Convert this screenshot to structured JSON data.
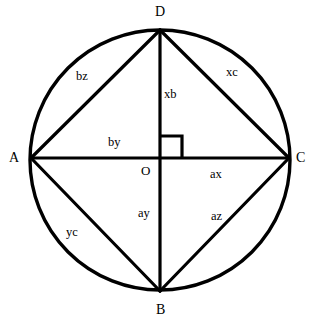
{
  "figure": {
    "background_color": "#ffffff",
    "stroke_color": "#000000",
    "circle": {
      "center_x": 160,
      "center_y": 160,
      "radius": 130,
      "stroke_width": 3.4
    },
    "vertices": [
      {
        "id": "D",
        "label": "D",
        "x": 160,
        "y": 30,
        "label_x": 155,
        "label_y": 5
      },
      {
        "id": "A",
        "label": "A",
        "x": 31,
        "y": 158,
        "label_x": 9,
        "label_y": 151
      },
      {
        "id": "C",
        "label": "C",
        "x": 289,
        "y": 158,
        "label_x": 296,
        "label_y": 151
      },
      {
        "id": "B",
        "label": "B",
        "x": 160,
        "y": 291,
        "label_x": 156,
        "label_y": 303
      },
      {
        "id": "O",
        "label": "O",
        "x": 160,
        "y": 158,
        "label_x": 141,
        "label_y": 164
      }
    ],
    "segments": [
      {
        "id": "AD",
        "from": "A",
        "to": "D",
        "label": "bz",
        "label_x": 76,
        "label_y": 70
      },
      {
        "id": "DC",
        "from": "D",
        "to": "C",
        "label": "xc",
        "label_x": 226,
        "label_y": 66
      },
      {
        "id": "DO",
        "from": "D",
        "to": "O",
        "label": "xb",
        "label_x": 164,
        "label_y": 88
      },
      {
        "id": "AO",
        "from": "A",
        "to": "O",
        "label": "by",
        "label_x": 108,
        "label_y": 136
      },
      {
        "id": "OC",
        "from": "O",
        "to": "C",
        "label": "ax",
        "label_x": 210,
        "label_y": 168
      },
      {
        "id": "OB",
        "from": "O",
        "to": "B",
        "label": "ay",
        "label_x": 138,
        "label_y": 207
      },
      {
        "id": "BC",
        "from": "B",
        "to": "C",
        "label": "az",
        "label_x": 211,
        "label_y": 210
      },
      {
        "id": "AB",
        "from": "A",
        "to": "B",
        "label": "yc",
        "label_x": 66,
        "label_y": 226
      }
    ],
    "right_angle_marker": {
      "at_vertex": "O",
      "x": 160,
      "y": 158,
      "size": 22,
      "direction": "upper-right",
      "stroke_width": 3.2
    },
    "line_stroke_width": 3.2
  }
}
